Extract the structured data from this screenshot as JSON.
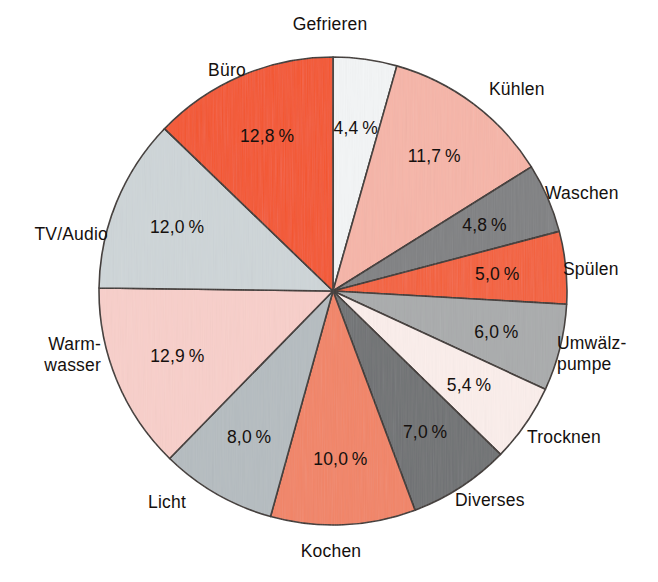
{
  "chart_data": {
    "type": "pie",
    "title": "",
    "subtitle": "",
    "xlabel": "",
    "ylabel": "",
    "legend_position": "outside-labels",
    "grid": false,
    "units": "%",
    "total": 100.0,
    "start_angle_deg": 0,
    "direction": "clockwise",
    "categories": [
      "Gefrieren",
      "Kühlen",
      "Waschen",
      "Spülen",
      "Umwälz-\npumpe",
      "Trocknen",
      "Diverses",
      "Kochen",
      "Licht",
      "Warm-\nwasser",
      "TV/Audio",
      "Büro"
    ],
    "values": [
      4.4,
      11.7,
      4.8,
      5.0,
      6.0,
      5.4,
      7.0,
      10.0,
      8.0,
      12.9,
      12.0,
      12.8
    ],
    "value_labels": [
      "4,4 %",
      "11,7 %",
      "4,8 %",
      "5,0 %",
      "6,0 %",
      "5,4 %",
      "7,0 %",
      "10,0 %",
      "8,0 %",
      "12,9 %",
      "12,0 %",
      "12,8 %"
    ],
    "colors": [
      "#f3f5f6",
      "#f6b5a8",
      "#7f8082",
      "#f4603a",
      "#a9abac",
      "#fbeeeb",
      "#6f7173",
      "#f28466",
      "#b5bcc0",
      "#f8cfca",
      "#ced5d8",
      "#f4552d"
    ],
    "slices": [
      {
        "label": "Gefrieren",
        "value": 4.4,
        "value_label": "4,4 %",
        "color": "#f3f5f6",
        "label_line1": "Gefrieren",
        "label_line2": ""
      },
      {
        "label": "Kühlen",
        "value": 11.7,
        "value_label": "11,7 %",
        "color": "#f6b5a8",
        "label_line1": "Kühlen",
        "label_line2": ""
      },
      {
        "label": "Waschen",
        "value": 4.8,
        "value_label": "4,8 %",
        "color": "#7f8082",
        "label_line1": "Waschen",
        "label_line2": ""
      },
      {
        "label": "Spülen",
        "value": 5.0,
        "value_label": "5,0 %",
        "color": "#f4603a",
        "label_line1": "Spülen",
        "label_line2": ""
      },
      {
        "label": "Umwälzpumpe",
        "value": 6.0,
        "value_label": "6,0 %",
        "color": "#a9abac",
        "label_line1": "Umwälz-",
        "label_line2": "pumpe"
      },
      {
        "label": "Trocknen",
        "value": 5.4,
        "value_label": "5,4 %",
        "color": "#fbeeeb",
        "label_line1": "Trocknen",
        "label_line2": ""
      },
      {
        "label": "Diverses",
        "value": 7.0,
        "value_label": "7,0 %",
        "color": "#6f7173",
        "label_line1": "Diverses",
        "label_line2": ""
      },
      {
        "label": "Kochen",
        "value": 10.0,
        "value_label": "10,0 %",
        "color": "#f28466",
        "label_line1": "Kochen",
        "label_line2": ""
      },
      {
        "label": "Licht",
        "value": 8.0,
        "value_label": "8,0 %",
        "color": "#b5bcc0",
        "label_line1": "Licht",
        "label_line2": ""
      },
      {
        "label": "Warmwasser",
        "value": 12.9,
        "value_label": "12,9 %",
        "color": "#f8cfca",
        "label_line1": "Warm-",
        "label_line2": "wasser"
      },
      {
        "label": "TV/Audio",
        "value": 12.0,
        "value_label": "12,0 %",
        "color": "#ced5d8",
        "label_line1": "TV/Audio",
        "label_line2": ""
      },
      {
        "label": "Büro",
        "value": 12.8,
        "value_label": "12,8 %",
        "color": "#f4552d",
        "label_line1": "Büro",
        "label_line2": ""
      }
    ]
  },
  "geometry": {
    "cx": 333,
    "cy": 291,
    "rx": 234,
    "ry": 234,
    "value_label_radius_factor": 0.72,
    "outline_color": "#3a3330"
  },
  "callout_labels": [
    {
      "name": "Gefrieren",
      "line1": "Gefrieren",
      "line2": "",
      "x": 330,
      "y": 30,
      "anchor": "middle"
    },
    {
      "name": "Kühlen",
      "line1": "Kühlen",
      "line2": "",
      "x": 489,
      "y": 95,
      "anchor": "start"
    },
    {
      "name": "Waschen",
      "line1": "Waschen",
      "line2": "",
      "x": 545,
      "y": 199,
      "anchor": "start"
    },
    {
      "name": "Spülen",
      "line1": "Spülen",
      "line2": "",
      "x": 563,
      "y": 275,
      "anchor": "start"
    },
    {
      "name": "Umwälzpumpe",
      "line1": "Umwälz-",
      "line2": "pumpe",
      "x": 557,
      "y": 349,
      "anchor": "start"
    },
    {
      "name": "Trocknen",
      "line1": "Trocknen",
      "line2": "",
      "x": 527,
      "y": 443,
      "anchor": "start"
    },
    {
      "name": "Diverses",
      "line1": "Diverses",
      "line2": "",
      "x": 455,
      "y": 506,
      "anchor": "start"
    },
    {
      "name": "Kochen",
      "line1": "Kochen",
      "line2": "",
      "x": 331,
      "y": 557,
      "anchor": "middle"
    },
    {
      "name": "Licht",
      "line1": "Licht",
      "line2": "",
      "x": 167,
      "y": 508,
      "anchor": "middle"
    },
    {
      "name": "Warmwasser",
      "line1": "Warm-",
      "line2": "wasser",
      "x": 101,
      "y": 350,
      "anchor": "end"
    },
    {
      "name": "TV/Audio",
      "line1": "TV/Audio",
      "line2": "",
      "x": 108,
      "y": 240,
      "anchor": "end"
    },
    {
      "name": "Büro",
      "line1": "Büro",
      "line2": "",
      "x": 227,
      "y": 76,
      "anchor": "middle"
    }
  ]
}
